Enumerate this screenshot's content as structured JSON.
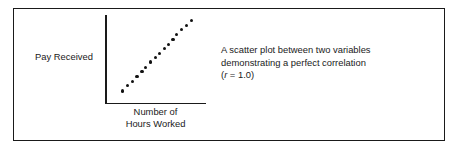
{
  "figure": {
    "border_color": "#1a1a1a",
    "background": "#ffffff",
    "axis_color": "#1a1a1a",
    "point_color": "#111111"
  },
  "axes": {
    "y_label": "Pay Received",
    "x_label_line1": "Number of",
    "x_label_line2": "Hours Worked"
  },
  "caption": {
    "line1": "A scatter plot between two variables",
    "line2": "demonstrating a perfect correlation",
    "line3_prefix": "(",
    "line3_symbol": "r",
    "line3_suffix": " = 1.0)"
  },
  "chart_data": {
    "type": "scatter",
    "title": "",
    "xlabel": "Number of Hours Worked",
    "ylabel": "Pay Received",
    "annotation": "A scatter plot between two variables demonstrating a perfect correlation (r = 1.0)",
    "correlation_r": 1.0,
    "grid": false,
    "legend": "none",
    "xlim": [
      0,
      100
    ],
    "ylim": [
      0,
      100
    ],
    "tick_labels_x": [],
    "tick_labels_y": [],
    "series": [
      {
        "name": "observations",
        "x": [
          16,
          21,
          26,
          31,
          36,
          40,
          45,
          50,
          54,
          59,
          63,
          68,
          72,
          77,
          82,
          87
        ],
        "y": [
          13,
          19,
          24,
          30,
          36,
          41,
          47,
          52,
          57,
          63,
          68,
          74,
          79,
          85,
          90,
          96
        ]
      }
    ]
  }
}
